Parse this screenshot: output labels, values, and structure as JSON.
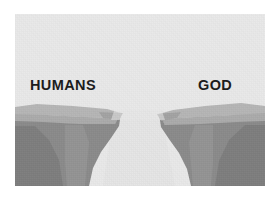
{
  "image": {
    "kind": "illustration",
    "subject": "canyon-chasm-divide",
    "width": 275,
    "height": 201,
    "plate": {
      "left": 15,
      "top": 14,
      "width": 250,
      "height": 172
    }
  },
  "palette": {
    "page_background": "#ffffff",
    "sky": "#e9e9e9",
    "chasm_floor": "#e4e4e4",
    "plateau_top_light": "#b6b6b6",
    "plateau_top_mid": "#ababab",
    "cliff_face_dark": "#8b8b8b",
    "cliff_face_darker": "#7e7e7e",
    "cliff_face_mid": "#979797",
    "label_text": "#1c1c1c"
  },
  "labels": {
    "left": {
      "text": "HUMANS",
      "side": "left",
      "x": 30,
      "y": 78
    },
    "right": {
      "text": "GOD",
      "side": "right",
      "x": 198,
      "y": 78
    }
  },
  "scene": {
    "description": "Two gray cliff ledges separated by a pale chasm widening toward the viewer",
    "left_cliff": {
      "name": "left-cliff",
      "tip_x": 120,
      "tip_y": 112
    },
    "right_cliff": {
      "name": "right-cliff",
      "tip_x": 160,
      "tip_y": 113
    },
    "gap": {
      "name": "chasm",
      "top_width": 40,
      "bottom_width": 130
    }
  }
}
